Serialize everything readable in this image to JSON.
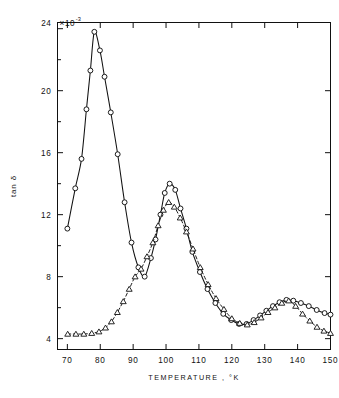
{
  "chart_data": {
    "type": "line",
    "title": "",
    "xlabel": "TEMPERATURE , °K",
    "ylabel": "tan δ",
    "y_exponent_label": "×10",
    "y_exponent_value": "-3",
    "y_top_label": "24",
    "xlim": [
      67,
      150
    ],
    "ylim": [
      3.3,
      24.4
    ],
    "xticks": [
      70,
      80,
      90,
      100,
      110,
      120,
      130,
      140,
      150
    ],
    "xtick_labels": [
      "70",
      "80",
      "90",
      "100",
      "110",
      "120",
      "130",
      "140",
      "150"
    ],
    "yticks": [
      4,
      8,
      12,
      16,
      20,
      24
    ],
    "ytick_labels": [
      "4",
      "8",
      "12",
      "16",
      "20",
      "24"
    ],
    "y_minor_ticks": [
      6,
      10,
      14,
      18,
      22
    ],
    "grid": false,
    "legend": "none",
    "frame": "box",
    "tick_direction": "in",
    "series": [
      {
        "name": "circles",
        "marker": "open-circle",
        "linestyle": "solid",
        "color": "#111111",
        "points": [
          [
            70.0,
            11.1
          ],
          [
            72.4,
            13.7
          ],
          [
            74.3,
            15.6
          ],
          [
            75.8,
            18.8
          ],
          [
            77.0,
            21.3
          ],
          [
            78.2,
            23.8
          ],
          [
            79.9,
            22.6
          ],
          [
            81.3,
            20.9
          ],
          [
            83.2,
            18.6
          ],
          [
            85.3,
            15.9
          ],
          [
            87.4,
            12.8
          ],
          [
            89.5,
            10.2
          ],
          [
            91.6,
            8.6
          ],
          [
            93.5,
            8.0
          ],
          [
            95.4,
            9.2
          ],
          [
            96.8,
            10.4
          ],
          [
            98.3,
            12.0
          ],
          [
            99.6,
            13.4
          ],
          [
            101.1,
            14.0
          ],
          [
            102.8,
            13.6
          ],
          [
            104.4,
            12.4
          ],
          [
            106.2,
            11.1
          ],
          [
            108.0,
            9.6
          ],
          [
            110.3,
            8.3
          ],
          [
            112.6,
            7.2
          ],
          [
            115.0,
            6.3
          ],
          [
            117.4,
            5.6
          ],
          [
            119.8,
            5.2
          ],
          [
            122.2,
            4.95
          ],
          [
            124.5,
            4.95
          ],
          [
            126.6,
            5.2
          ],
          [
            128.6,
            5.5
          ],
          [
            130.5,
            5.8
          ],
          [
            132.5,
            6.1
          ],
          [
            134.5,
            6.35
          ],
          [
            136.6,
            6.5
          ],
          [
            138.7,
            6.45
          ],
          [
            141.0,
            6.3
          ],
          [
            143.4,
            6.1
          ],
          [
            145.8,
            5.85
          ],
          [
            148.2,
            5.65
          ],
          [
            150.0,
            5.55
          ]
        ]
      },
      {
        "name": "triangles",
        "marker": "open-triangle",
        "linestyle": "dashed",
        "color": "#111111",
        "points": [
          [
            70.1,
            4.3
          ],
          [
            72.6,
            4.3
          ],
          [
            75.0,
            4.3
          ],
          [
            77.4,
            4.35
          ],
          [
            79.6,
            4.45
          ],
          [
            81.6,
            4.7
          ],
          [
            83.4,
            5.1
          ],
          [
            85.2,
            5.7
          ],
          [
            87.0,
            6.4
          ],
          [
            88.8,
            7.2
          ],
          [
            90.6,
            8.0
          ],
          [
            92.4,
            8.5
          ],
          [
            94.2,
            9.3
          ],
          [
            96.0,
            10.2
          ],
          [
            97.6,
            11.3
          ],
          [
            99.2,
            12.3
          ],
          [
            100.8,
            12.8
          ],
          [
            102.5,
            12.5
          ],
          [
            104.3,
            11.8
          ],
          [
            106.2,
            10.9
          ],
          [
            108.2,
            9.8
          ],
          [
            110.4,
            8.6
          ],
          [
            112.8,
            7.5
          ],
          [
            115.2,
            6.6
          ],
          [
            117.6,
            5.9
          ],
          [
            120.0,
            5.3
          ],
          [
            122.4,
            5.0
          ],
          [
            124.7,
            4.9
          ],
          [
            126.8,
            5.05
          ],
          [
            128.9,
            5.35
          ],
          [
            131.0,
            5.7
          ],
          [
            133.1,
            6.0
          ],
          [
            135.2,
            6.3
          ],
          [
            137.3,
            6.45
          ],
          [
            139.4,
            6.1
          ],
          [
            141.5,
            5.6
          ],
          [
            143.7,
            5.15
          ],
          [
            145.9,
            4.75
          ],
          [
            148.0,
            4.5
          ],
          [
            150.0,
            4.35
          ]
        ]
      }
    ]
  }
}
